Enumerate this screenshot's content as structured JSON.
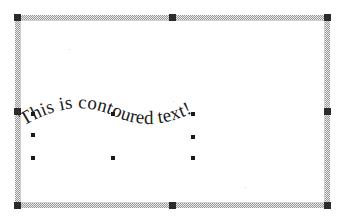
{
  "canvas": {
    "name": "drawing-canvas",
    "background_color": "#ffffff",
    "frame_border_color": "#9a9a9a",
    "frame_handle_color": "#2b2b2b",
    "frame_handles": [
      {
        "name": "frame-handle-top-left",
        "position": "nw"
      },
      {
        "name": "frame-handle-top-center",
        "position": "n"
      },
      {
        "name": "frame-handle-top-right",
        "position": "ne"
      },
      {
        "name": "frame-handle-middle-left",
        "position": "w"
      },
      {
        "name": "frame-handle-middle-right",
        "position": "e"
      },
      {
        "name": "frame-handle-bottom-left",
        "position": "sw"
      },
      {
        "name": "frame-handle-bottom-center",
        "position": "s"
      },
      {
        "name": "frame-handle-bottom-right",
        "position": "se"
      }
    ]
  },
  "text_object": {
    "content": "This is contoured text!",
    "shape": "wave",
    "font_style": "serif",
    "color": "#1c1c1c",
    "handle_color": "#1a1a1a",
    "handles": [
      {
        "name": "object-handle-top-left",
        "x": 31,
        "y": 112
      },
      {
        "name": "object-handle-top-center",
        "x": 111,
        "y": 112
      },
      {
        "name": "object-handle-top-right",
        "x": 191,
        "y": 112
      },
      {
        "name": "object-handle-middle-left",
        "x": 31,
        "y": 133
      },
      {
        "name": "object-handle-middle-right",
        "x": 191,
        "y": 135
      },
      {
        "name": "object-handle-bottom-left",
        "x": 31,
        "y": 156
      },
      {
        "name": "object-handle-bottom-center",
        "x": 111,
        "y": 156
      },
      {
        "name": "object-handle-bottom-right",
        "x": 191,
        "y": 156
      }
    ]
  }
}
